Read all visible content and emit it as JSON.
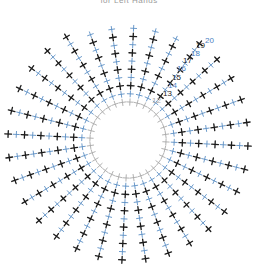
{
  "caption": "for Left Hands",
  "diagram": {
    "type": "crochet-stitch-chart",
    "center": [
      128,
      140
    ],
    "inner_radius": 38,
    "spoke_count": 32,
    "colors": {
      "black_stitch": "#1a1a1a",
      "blue_stitch": "#5b8fc4",
      "gray_stitch": "#a8a8a8",
      "blue_label": "#4a7fbf"
    },
    "row_labels": [
      {
        "text": "12",
        "x": 152,
        "y": 103,
        "color": "#a8a8a8"
      },
      {
        "text": "13",
        "x": 163,
        "y": 96,
        "color": "#1a1a1a"
      },
      {
        "text": "14",
        "x": 168,
        "y": 88,
        "color": "#4a7fbf"
      },
      {
        "text": "15",
        "x": 172,
        "y": 80,
        "color": "#1a1a1a"
      },
      {
        "text": "16",
        "x": 177,
        "y": 71,
        "color": "#4a7fbf"
      },
      {
        "text": "17",
        "x": 183,
        "y": 63,
        "color": "#1a1a1a"
      },
      {
        "text": "18",
        "x": 191,
        "y": 56,
        "color": "#4a7fbf"
      },
      {
        "text": "19",
        "x": 196,
        "y": 48,
        "color": "#1a1a1a"
      },
      {
        "text": "20",
        "x": 205,
        "y": 43,
        "color": "#4a7fbf"
      }
    ]
  }
}
